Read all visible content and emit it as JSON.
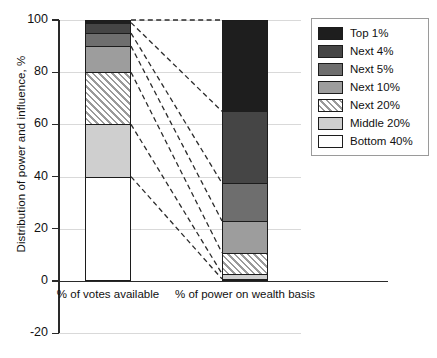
{
  "chart_data": {
    "type": "bar",
    "title": "",
    "subtitle": "",
    "xlabel": "",
    "ylabel": "Distribution of power and influence, %",
    "ylim": [
      -20,
      100
    ],
    "yticks": [
      -20,
      0,
      20,
      40,
      60,
      80,
      100
    ],
    "ytick_labels": [
      "-20",
      "0",
      "20",
      "40",
      "60",
      "80",
      "100"
    ],
    "grid": true,
    "stacked": true,
    "legend_position": "right",
    "categories": [
      "% of votes available",
      "% of power on wealth basis"
    ],
    "series": [
      {
        "name": "Bottom 40%",
        "values": [
          40,
          0.8
        ],
        "color": "#ffffff",
        "pattern": "solid"
      },
      {
        "name": "Middle 20%",
        "values": [
          20,
          2.0
        ],
        "color": "#cfcfcf",
        "pattern": "solid"
      },
      {
        "name": "Next 20%",
        "values": [
          20,
          8.0
        ],
        "color": "#ffffff",
        "pattern": "diagonal-hatch"
      },
      {
        "name": "Next 10%",
        "values": [
          10,
          12.2
        ],
        "color": "#9d9d9d",
        "pattern": "solid"
      },
      {
        "name": "Next 5%",
        "values": [
          5,
          14.5
        ],
        "color": "#6e6e6e",
        "pattern": "solid"
      },
      {
        "name": "Next 4%",
        "values": [
          4,
          27.5
        ],
        "color": "#454545",
        "pattern": "solid"
      },
      {
        "name": "Top 1%",
        "values": [
          1,
          35.0
        ],
        "color": "#1e1e1e",
        "pattern": "solid"
      }
    ],
    "connectors": {
      "style": "dashed",
      "description": "Dashed lines link each stack boundary of the left bar to the corresponding boundary of the right bar",
      "boundary_values_left": [
        100,
        99,
        95,
        90,
        80,
        60,
        40
      ],
      "boundary_values_right": [
        100,
        65,
        37.5,
        23,
        10.8,
        2.8,
        0.8
      ]
    }
  },
  "axes": {
    "y_title": "Distribution of power and influence, %",
    "y_ticks": [
      "100",
      "80",
      "60",
      "40",
      "20",
      "0",
      "-20"
    ],
    "x_categories": [
      {
        "label": "% of votes available"
      },
      {
        "label": "% of power on wealth basis"
      }
    ]
  },
  "legend": {
    "items": [
      {
        "label": "Top 1%",
        "color": "#1e1e1e"
      },
      {
        "label": "Next 4%",
        "color": "#454545"
      },
      {
        "label": "Next 5%",
        "color": "#6e6e6e"
      },
      {
        "label": "Next 10%",
        "color": "#9d9d9d"
      },
      {
        "label": "Next 20%",
        "color": "#ffffff"
      },
      {
        "label": "Middle 20%",
        "color": "#cfcfcf"
      },
      {
        "label": "Bottom 40%",
        "color": "#ffffff"
      }
    ]
  }
}
